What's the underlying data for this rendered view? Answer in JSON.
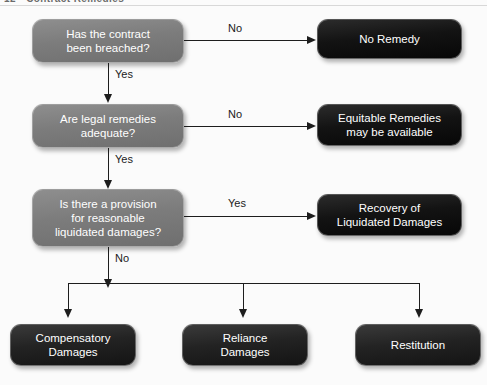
{
  "page": {
    "running_header": "12 • Contract Remedies"
  },
  "diagram": {
    "type": "flowchart",
    "nodes": [
      {
        "id": "q1",
        "kind": "decision",
        "label": "Has the contract\nbeen breached?"
      },
      {
        "id": "r1",
        "kind": "terminal",
        "label": "No Remedy"
      },
      {
        "id": "q2",
        "kind": "decision",
        "label": "Are legal remedies\nadequate?"
      },
      {
        "id": "r2",
        "kind": "terminal",
        "label": "Equitable Remedies\nmay be available"
      },
      {
        "id": "q3",
        "kind": "decision",
        "label": "Is there a provision\nfor reasonable\nliquidated damages?"
      },
      {
        "id": "r3",
        "kind": "terminal",
        "label": "Recovery of\nLiquidated Damages"
      },
      {
        "id": "o1",
        "kind": "outcome",
        "label": "Compensatory\nDamages"
      },
      {
        "id": "o2",
        "kind": "outcome",
        "label": "Reliance\nDamages"
      },
      {
        "id": "o3",
        "kind": "outcome",
        "label": "Restitution"
      }
    ],
    "edges": [
      {
        "from": "q1",
        "to": "r1",
        "label": "No"
      },
      {
        "from": "q1",
        "to": "q2",
        "label": "Yes"
      },
      {
        "from": "q2",
        "to": "r2",
        "label": "No"
      },
      {
        "from": "q2",
        "to": "q3",
        "label": "Yes"
      },
      {
        "from": "q3",
        "to": "r3",
        "label": "Yes"
      },
      {
        "from": "q3",
        "to": "o1",
        "label": "No"
      },
      {
        "from": "q3",
        "to": "o2",
        "label": ""
      },
      {
        "from": "q3",
        "to": "o3",
        "label": ""
      }
    ],
    "edge_labels": {
      "row1_no": "No",
      "row1_yes": "Yes",
      "row2_no": "No",
      "row2_yes": "Yes",
      "row3_yes": "Yes",
      "row3_no": "No"
    },
    "colors": {
      "decision_fill": "#7c7c7c",
      "terminal_fill": "#131313",
      "outcome_fill": "#232323",
      "connector": "#1d1d1d",
      "node_text": "#ffffff",
      "label_text": "#1a1a1a",
      "background": "#fbfbfb"
    }
  }
}
